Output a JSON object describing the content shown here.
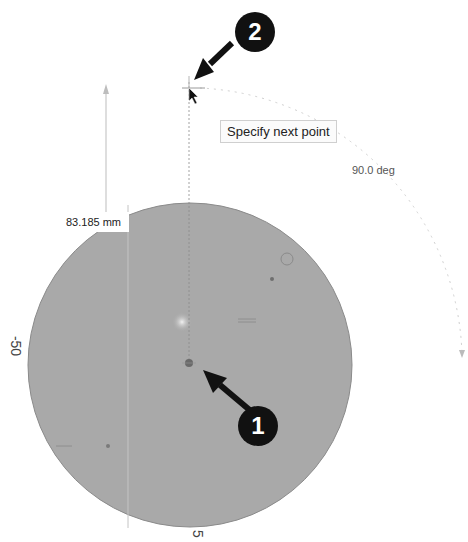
{
  "viewport": {
    "tooltip": "Specify next point",
    "dimension_value": "83.185 mm",
    "angle_value": "90.0 deg",
    "axis_label_left": "-50",
    "axis_label_bottom": "5"
  },
  "callouts": [
    {
      "number": "1",
      "target": "center-point"
    },
    {
      "number": "2",
      "target": "cursor-next-point"
    }
  ],
  "colors": {
    "disk_fill": "#a9a9a9",
    "callout_bg": "#111111",
    "background": "#ffffff"
  }
}
